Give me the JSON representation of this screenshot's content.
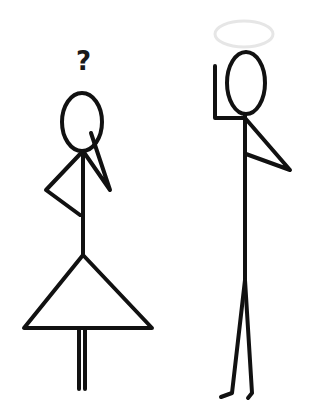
{
  "figures": {
    "left": {
      "label": "confused-stick-figure",
      "thought": "?"
    },
    "right": {
      "label": "stick-figure-with-halo"
    }
  },
  "colors": {
    "stroke": "#111111",
    "halo": "#e6e6e6",
    "background": "#ffffff"
  }
}
